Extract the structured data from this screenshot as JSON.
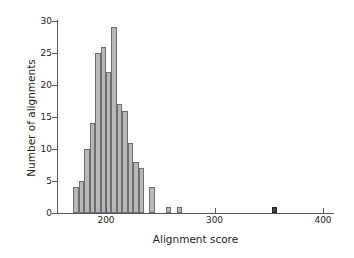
{
  "chart_data": {
    "type": "bar",
    "title": "",
    "subtitle": "",
    "xlabel": "Alignment score",
    "ylabel": "Number of alignments",
    "xlim": [
      160,
      405
    ],
    "ylim": [
      0,
      30
    ],
    "grid": false,
    "legend": null,
    "bin_width": 5,
    "xticks": [
      200,
      300,
      400
    ],
    "xtick_labels": [
      "200",
      "300",
      "400"
    ],
    "yticks": [
      0,
      5,
      10,
      15,
      20,
      25,
      30
    ],
    "ytick_labels": [
      "0",
      "5",
      "10",
      "15",
      "20",
      "25",
      "30"
    ],
    "bins": [
      {
        "x": 170,
        "value": 4,
        "color": "light"
      },
      {
        "x": 175,
        "value": 5,
        "color": "light"
      },
      {
        "x": 180,
        "value": 10,
        "color": "light"
      },
      {
        "x": 185,
        "value": 14,
        "color": "light"
      },
      {
        "x": 190,
        "value": 25,
        "color": "light"
      },
      {
        "x": 195,
        "value": 26,
        "color": "light"
      },
      {
        "x": 200,
        "value": 22,
        "color": "light"
      },
      {
        "x": 205,
        "value": 29,
        "color": "light"
      },
      {
        "x": 210,
        "value": 17,
        "color": "light"
      },
      {
        "x": 215,
        "value": 16,
        "color": "light"
      },
      {
        "x": 220,
        "value": 11,
        "color": "light"
      },
      {
        "x": 225,
        "value": 8,
        "color": "light"
      },
      {
        "x": 230,
        "value": 7,
        "color": "light"
      },
      {
        "x": 240,
        "value": 4,
        "color": "light"
      },
      {
        "x": 255,
        "value": 1,
        "color": "light"
      },
      {
        "x": 265,
        "value": 1,
        "color": "light"
      },
      {
        "x": 353,
        "value": 1,
        "color": "dark"
      }
    ],
    "colors": {
      "bar_light": "#b8b8b8",
      "bar_dark": "#404040",
      "bar_edge": "#6d6e70",
      "axis": "#58595b",
      "text": "#231f20",
      "background": "#ffffff"
    }
  }
}
